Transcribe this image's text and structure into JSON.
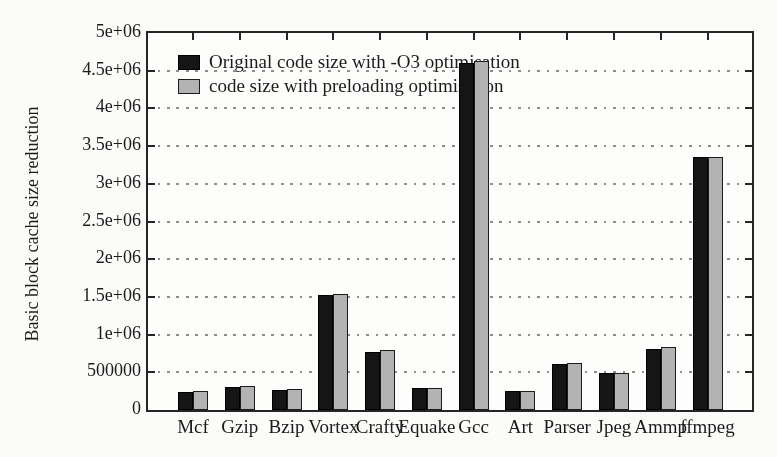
{
  "chart_data": {
    "type": "bar",
    "title": "",
    "xlabel": "",
    "ylabel": "Basic block cache size reduction",
    "categories": [
      "Mcf",
      "Gzip",
      "Bzip",
      "Vortex",
      "Crafty",
      "Equake",
      "Gcc",
      "Art",
      "Parser",
      "Jpeg",
      "Ammp",
      "ffmpeg"
    ],
    "series": [
      {
        "name": "Original code size with -O3 optimisation",
        "color": "#151515",
        "values": [
          240000,
          305000,
          272000,
          1520000,
          775000,
          287000,
          4600000,
          250000,
          612000,
          487000,
          812000,
          3350000
        ]
      },
      {
        "name": "code size with preloading optimisation",
        "color": "#b3b3b3",
        "values": [
          250000,
          320000,
          284000,
          1540000,
          792000,
          291000,
          4635000,
          253000,
          626000,
          493000,
          833000,
          3360000
        ]
      }
    ],
    "ylim": [
      0,
      5000000
    ],
    "ytick_values": [
      0,
      500000,
      1000000,
      1500000,
      2000000,
      2500000,
      3000000,
      3500000,
      4000000,
      4500000,
      5000000
    ],
    "ytick_labels": [
      "0",
      "500000",
      "1e+06",
      "1.5e+06",
      "2e+06",
      "2.5e+06",
      "3e+06",
      "3.5e+06",
      "4e+06",
      "4.5e+06",
      "5e+06"
    ],
    "grid": "horizontal dotted lines at every y tick",
    "legend_position": "top-left inside plot"
  },
  "colors": {
    "background": "#fbfbf9",
    "axis": "#262626",
    "grid": "#8e8e8e",
    "text": "#1b1b1b",
    "bar_original": "#151515",
    "bar_preloading": "#b3b3b3"
  }
}
